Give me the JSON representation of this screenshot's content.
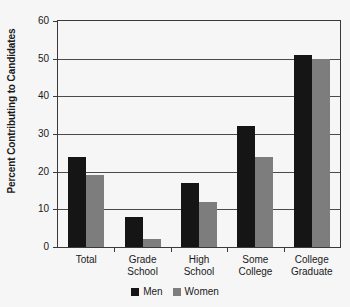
{
  "chart_data": {
    "type": "bar",
    "title": "",
    "subtitle": "",
    "xlabel": "",
    "ylabel": "Percent Contributing to Candidates",
    "categories": [
      "Total",
      "Grade School",
      "High School",
      "Some College",
      "College Graduate"
    ],
    "category_lines": [
      [
        "Total"
      ],
      [
        "Grade",
        "School"
      ],
      [
        "High",
        "School"
      ],
      [
        "Some",
        "College"
      ],
      [
        "College",
        "Graduate"
      ]
    ],
    "series": [
      {
        "name": "Men",
        "color": "#151515",
        "values": [
          24,
          8,
          17,
          32,
          51
        ]
      },
      {
        "name": "Women",
        "color": "#7d7d7d",
        "values": [
          19,
          2,
          12,
          24,
          50
        ]
      }
    ],
    "ylim": [
      0,
      60
    ],
    "yticks": [
      0,
      10,
      20,
      30,
      40,
      50,
      60
    ],
    "ytick_labels": [
      "0",
      "10",
      "20",
      "30",
      "40",
      "50",
      "60"
    ],
    "grid": true,
    "grid_axis": "y",
    "legend_position": "bottom-center",
    "legend_entries": [
      "Men",
      "Women"
    ]
  },
  "axes": {
    "y_title": "Percent Contributing to Candidates",
    "y_ticks": [
      "60",
      "50",
      "40",
      "30",
      "20",
      "10",
      "0"
    ]
  },
  "legend": {
    "men_label": "Men",
    "women_label": "Women"
  },
  "colors": {
    "men": "#151515",
    "women": "#7d7d7d",
    "axis": "#3a3a3a",
    "grid": "#4a4a4a",
    "background": "#f6f6f6",
    "text": "#1a1a1a"
  }
}
